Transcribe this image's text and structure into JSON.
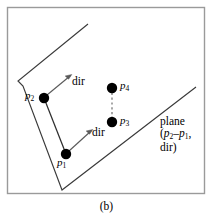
{
  "figure": {
    "caption": "(b)",
    "frame": {
      "stroke": "#9a9a9a",
      "fill": "#ffffff"
    },
    "colors": {
      "line": "#3a3a3a",
      "dot": "#000000",
      "arrow": "#555555",
      "dashed": "#777777",
      "text": "#000000"
    },
    "labels": {
      "p1": "p",
      "p1_sub": "1",
      "p2": "p",
      "p2_sub": "2",
      "p3": "p",
      "p3_sub": "3",
      "p4": "p",
      "p4_sub": "4",
      "dir_upper": "dir",
      "dir_lower": "dir",
      "plane_line1": "plane",
      "plane_line2_open": "(",
      "plane_line2_a": "p",
      "plane_line2_a_sub": "2",
      "plane_line2_minus": "–",
      "plane_line2_b": "p",
      "plane_line2_b_sub": "1",
      "plane_line2_comma": ",",
      "plane_line3": "dir)"
    },
    "geometry": {
      "points": [
        {
          "name": "p2",
          "x": 44,
          "y": 98,
          "r": 5.2
        },
        {
          "name": "p1",
          "x": 66,
          "y": 154,
          "r": 5.2
        },
        {
          "name": "p4",
          "x": 112,
          "y": 88,
          "r": 5.2
        },
        {
          "name": "p3",
          "x": 112,
          "y": 122,
          "r": 5.2
        }
      ],
      "wedge_path": "M 88,24 L 18,81 L 23,86 L 62,190 L 196,87",
      "segment_p2_p1": {
        "x1": 44,
        "y1": 98,
        "x2": 66,
        "y2": 154
      },
      "dashed_p4_p3": {
        "x1": 112,
        "y1": 88,
        "x2": 112,
        "y2": 122
      },
      "arrow_upper": {
        "x1": 47,
        "y1": 95,
        "x2": 71,
        "y2": 75
      },
      "arrow_lower": {
        "x1": 69,
        "y1": 151,
        "x2": 92,
        "y2": 130
      }
    }
  }
}
